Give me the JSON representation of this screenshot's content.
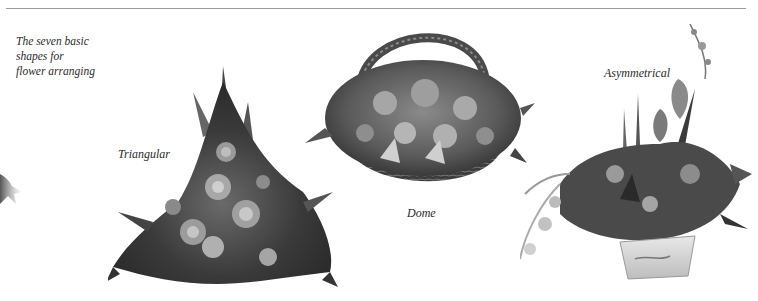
{
  "page": {
    "cutoff_header": "· · · · · · · · · · · ·",
    "intro_caption": {
      "lines": [
        "The seven basic",
        "shapes for",
        "flower arranging"
      ]
    },
    "figures": [
      {
        "id": "triangular",
        "label": "Triangular",
        "description": "Triangular flower arrangement of roses, carnations and foliage"
      },
      {
        "id": "dome",
        "label": "Dome",
        "description": "Dome-shaped flower arrangement in a woven wicker basket"
      },
      {
        "id": "asymmetrical",
        "label": "Asymmetrical",
        "description": "Asymmetrical flower arrangement with irises and orchid spray in a ceramic bowl"
      }
    ]
  },
  "colors": {
    "text": "#2a2a2a",
    "rule": "#9a9a9a",
    "background": "#ffffff"
  }
}
